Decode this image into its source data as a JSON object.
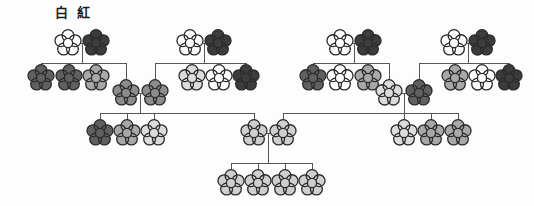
{
  "figure": {
    "type": "pedigree-chart"
  },
  "legend": {
    "x": 55,
    "y": 6,
    "items": [
      {
        "label": "白",
        "meaning": "white",
        "color": "#ffffff"
      },
      {
        "label": "紅",
        "meaning": "crimson",
        "color": "#3c3c3c"
      }
    ]
  },
  "palette": {
    "white": "#ffffff",
    "light": "#dcdcdc",
    "light_medium": "#cfcfcf",
    "medium": "#a8a8a8",
    "medium_dark": "#8c8c8c",
    "dark": "#606060",
    "darkest": "#3c3c3c",
    "outline": "#2b2b2b",
    "line": "#555555",
    "background": "#fdfdfd"
  },
  "geometry": {
    "flower_radius": 13,
    "petal_count": 5,
    "center_radius": 4.6,
    "outline_width": 1.3,
    "connector_width": 1.0
  },
  "chart_data": {
    "type": "pedigree",
    "generations": 4,
    "generation_rows": [
      {
        "index": 1,
        "y": 43,
        "label": "P"
      },
      {
        "index": 2,
        "y": 78,
        "label": "F1"
      },
      {
        "index": 3,
        "y": 93,
        "label": "F2"
      },
      {
        "index": 4,
        "y": 133,
        "label": "F3"
      },
      {
        "index": 5,
        "y": 183,
        "label": "F4"
      }
    ],
    "nodes": [
      {
        "id": "A1",
        "x": 68,
        "y": 43,
        "shade": "white",
        "gen": 1,
        "family": 1,
        "role": "parent"
      },
      {
        "id": "A2",
        "x": 96,
        "y": 43,
        "shade": "darkest",
        "gen": 1,
        "family": 1,
        "role": "parent"
      },
      {
        "id": "A3",
        "x": 41,
        "y": 78,
        "shade": "dark",
        "gen": 2,
        "family": 1,
        "role": "child"
      },
      {
        "id": "A4",
        "x": 69,
        "y": 78,
        "shade": "dark",
        "gen": 2,
        "family": 1,
        "role": "child"
      },
      {
        "id": "A5",
        "x": 96,
        "y": 78,
        "shade": "medium",
        "gen": 2,
        "family": 1,
        "role": "child"
      },
      {
        "id": "A6",
        "x": 126,
        "y": 93,
        "shade": "medium_dark",
        "gen": 2,
        "family": 1,
        "role": "child-mate"
      },
      {
        "id": "B1",
        "x": 190,
        "y": 43,
        "shade": "white",
        "gen": 1,
        "family": 2,
        "role": "parent"
      },
      {
        "id": "B2",
        "x": 218,
        "y": 43,
        "shade": "darkest",
        "gen": 1,
        "family": 2,
        "role": "parent"
      },
      {
        "id": "B3",
        "x": 155,
        "y": 93,
        "shade": "medium_dark",
        "gen": 2,
        "family": 2,
        "role": "child-mate"
      },
      {
        "id": "B4",
        "x": 192,
        "y": 78,
        "shade": "light",
        "gen": 2,
        "family": 2,
        "role": "child"
      },
      {
        "id": "B5",
        "x": 219,
        "y": 78,
        "shade": "white",
        "gen": 2,
        "family": 2,
        "role": "child"
      },
      {
        "id": "B6",
        "x": 246,
        "y": 78,
        "shade": "darkest",
        "gen": 2,
        "family": 2,
        "role": "child"
      },
      {
        "id": "C1",
        "x": 340,
        "y": 43,
        "shade": "white",
        "gen": 1,
        "family": 3,
        "role": "parent"
      },
      {
        "id": "C2",
        "x": 368,
        "y": 43,
        "shade": "darkest",
        "gen": 1,
        "family": 3,
        "role": "parent"
      },
      {
        "id": "C3",
        "x": 313,
        "y": 78,
        "shade": "dark",
        "gen": 2,
        "family": 3,
        "role": "child"
      },
      {
        "id": "C4",
        "x": 340,
        "y": 78,
        "shade": "white",
        "gen": 2,
        "family": 3,
        "role": "child"
      },
      {
        "id": "C5",
        "x": 368,
        "y": 78,
        "shade": "medium",
        "gen": 2,
        "family": 3,
        "role": "child"
      },
      {
        "id": "C6",
        "x": 389,
        "y": 93,
        "shade": "light",
        "gen": 2,
        "family": 3,
        "role": "child-mate"
      },
      {
        "id": "D1",
        "x": 454,
        "y": 43,
        "shade": "white",
        "gen": 1,
        "family": 4,
        "role": "parent"
      },
      {
        "id": "D2",
        "x": 482,
        "y": 43,
        "shade": "darkest",
        "gen": 1,
        "family": 4,
        "role": "parent"
      },
      {
        "id": "D3",
        "x": 419,
        "y": 93,
        "shade": "dark",
        "gen": 2,
        "family": 4,
        "role": "child-mate"
      },
      {
        "id": "D4",
        "x": 455,
        "y": 78,
        "shade": "medium",
        "gen": 2,
        "family": 4,
        "role": "child"
      },
      {
        "id": "D5",
        "x": 482,
        "y": 78,
        "shade": "white",
        "gen": 2,
        "family": 4,
        "role": "child"
      },
      {
        "id": "D6",
        "x": 509,
        "y": 78,
        "shade": "darkest",
        "gen": 2,
        "family": 4,
        "role": "child"
      },
      {
        "id": "E1",
        "x": 100,
        "y": 133,
        "shade": "dark",
        "gen": 3,
        "family": 5,
        "role": "child"
      },
      {
        "id": "E2",
        "x": 127,
        "y": 133,
        "shade": "medium",
        "gen": 3,
        "family": 5,
        "role": "child"
      },
      {
        "id": "E3",
        "x": 154,
        "y": 133,
        "shade": "light",
        "gen": 3,
        "family": 5,
        "role": "child"
      },
      {
        "id": "F1",
        "x": 404,
        "y": 133,
        "shade": "light",
        "gen": 3,
        "family": 6,
        "role": "child"
      },
      {
        "id": "F2",
        "x": 431,
        "y": 133,
        "shade": "medium",
        "gen": 3,
        "family": 6,
        "role": "child"
      },
      {
        "id": "F3",
        "x": 458,
        "y": 133,
        "shade": "medium",
        "gen": 3,
        "family": 6,
        "role": "child"
      },
      {
        "id": "G1",
        "x": 254,
        "y": 133,
        "shade": "light_medium",
        "gen": 3,
        "family": 7,
        "role": "parent"
      },
      {
        "id": "G2",
        "x": 283,
        "y": 133,
        "shade": "light_medium",
        "gen": 3,
        "family": 7,
        "role": "parent"
      },
      {
        "id": "H1",
        "x": 231,
        "y": 183,
        "shade": "light_medium",
        "gen": 4,
        "family": 7,
        "role": "child"
      },
      {
        "id": "H2",
        "x": 258,
        "y": 183,
        "shade": "light_medium",
        "gen": 4,
        "family": 7,
        "role": "child"
      },
      {
        "id": "H3",
        "x": 285,
        "y": 183,
        "shade": "light_medium",
        "gen": 4,
        "family": 7,
        "role": "child"
      },
      {
        "id": "H4",
        "x": 312,
        "y": 183,
        "shade": "light_medium",
        "gen": 4,
        "family": 7,
        "role": "child"
      }
    ],
    "matings": [
      {
        "id": "M1",
        "partners": [
          "A1",
          "A2"
        ],
        "sib_y": 63,
        "children": [
          "A3",
          "A4",
          "A5",
          "A6"
        ]
      },
      {
        "id": "M2",
        "partners": [
          "B1",
          "B2"
        ],
        "sib_y": 63,
        "children": [
          "B3",
          "B4",
          "B5",
          "B6"
        ]
      },
      {
        "id": "M3",
        "partners": [
          "C1",
          "C2"
        ],
        "sib_y": 63,
        "children": [
          "C3",
          "C4",
          "C5",
          "C6"
        ]
      },
      {
        "id": "M4",
        "partners": [
          "D1",
          "D2"
        ],
        "sib_y": 63,
        "children": [
          "D3",
          "D4",
          "D5",
          "D6"
        ]
      },
      {
        "id": "M5",
        "partners": [
          "A6",
          "B3"
        ],
        "sib_y": 113,
        "children": [
          "E1",
          "E2",
          "E3",
          "G1"
        ]
      },
      {
        "id": "M6",
        "partners": [
          "C6",
          "D3"
        ],
        "sib_y": 113,
        "children": [
          "F1",
          "F2",
          "F3",
          "G2"
        ]
      },
      {
        "id": "M7",
        "partners": [
          "G1",
          "G2"
        ],
        "sib_y": 163,
        "children": [
          "H1",
          "H2",
          "H3",
          "H4"
        ]
      }
    ]
  }
}
